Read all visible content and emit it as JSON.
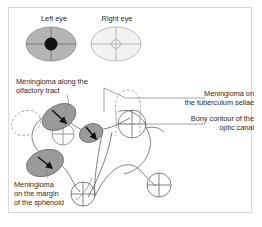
{
  "figure": {
    "background_color": "#ffffff",
    "frame_color": "#d8d8d8"
  },
  "visual_fields": {
    "left": {
      "label": "Left eye",
      "field_fill": "#b4b4b4",
      "defect_fill": "#111111",
      "defect_shape": "central-scotoma",
      "crosshair_color": "#6e6e6e"
    },
    "right": {
      "label": "Right eye",
      "field_fill": "#f2f2f2",
      "defect_fill": "#f2f2f2",
      "defect_shape": "small-central-ring",
      "crosshair_color": "#a8a8a8"
    }
  },
  "labels": {
    "olfactory": "Meningioma along the\nolfactory tract",
    "tuberculum": "Meningioma on\nthe tuberculum sellae",
    "optic_canal": "Bony contour of the\noptic canal",
    "sphenoid": "Meningioma\non the margin\nof the sphenoid"
  },
  "anatomy": {
    "tumor_fill": "#9a9a9a",
    "tumor_stroke": "#6a6a6a",
    "dashed_stroke": "#9a9a9a",
    "contour_stroke": "#6a6a6a",
    "arrow_color": "#111111",
    "leader_color": "#8a8a8a",
    "tumors": [
      {
        "name": "olfactory-tract-tumor",
        "cx": 59,
        "cy": 117,
        "rx": 18,
        "ry": 12,
        "rotation": -28
      },
      {
        "name": "sphenoid-margin-tumor",
        "cx": 45,
        "cy": 163,
        "rx": 19,
        "ry": 13,
        "rotation": -18
      },
      {
        "name": "tuberculum-sellae-tumor",
        "cx": 91,
        "cy": 133,
        "rx": 12,
        "ry": 9,
        "rotation": -22
      }
    ],
    "dashed_outlines": [
      {
        "name": "dashed-olfactory-left",
        "cx": 26,
        "cy": 123,
        "rx": 15,
        "ry": 12,
        "rotation": -25
      },
      {
        "name": "dashed-tuberculum-upper",
        "cx": 128,
        "cy": 97,
        "rx": 14,
        "ry": 15,
        "rotation": 0
      }
    ],
    "optic_canal_circles": [
      {
        "name": "optic-canal-right",
        "cx": 132,
        "cy": 124,
        "r": 14
      },
      {
        "name": "optic-canal-lower-left",
        "cx": 83,
        "cy": 194,
        "r": 12
      },
      {
        "name": "optic-canal-lower-right",
        "cx": 159,
        "cy": 185,
        "r": 12
      },
      {
        "name": "optic-canal-left",
        "cx": 63,
        "cy": 134,
        "r": 11
      }
    ]
  }
}
